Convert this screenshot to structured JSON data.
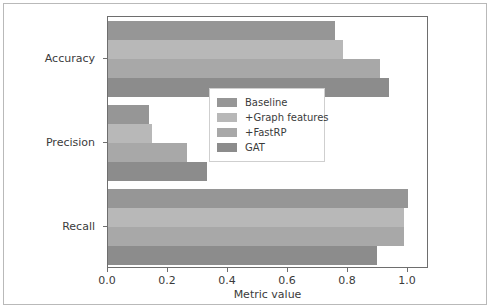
{
  "chart_data": {
    "type": "bar",
    "orientation": "horizontal",
    "title": "",
    "xlabel": "Metric value",
    "ylabel": "",
    "categories": [
      "Accuracy",
      "Precision",
      "Recall"
    ],
    "series": [
      {
        "name": "Baseline",
        "color": "#969696",
        "values": [
          0.758,
          0.136,
          1.0
        ]
      },
      {
        "name": "+Graph features",
        "color": "#b8b8b8",
        "values": [
          0.784,
          0.146,
          0.985
        ]
      },
      {
        "name": "+FastRP",
        "color": "#a8a8a8",
        "values": [
          0.905,
          0.264,
          0.985
        ]
      },
      {
        "name": "GAT",
        "color": "#8c8c8c",
        "values": [
          0.937,
          0.33,
          0.895
        ]
      }
    ],
    "xlim": [
      0.0,
      1.07
    ],
    "xticks": [
      0.0,
      0.2,
      0.4,
      0.6,
      0.8,
      1.0
    ],
    "xtick_labels": [
      "0.0",
      "0.2",
      "0.4",
      "0.6",
      "0.8",
      "1.0"
    ],
    "grid": false,
    "legend_position": "upper right",
    "legend_entries": [
      "Baseline",
      "+Graph features",
      "+FastRP",
      "GAT"
    ]
  },
  "figure": {
    "background_color": "#ffffff",
    "axes_edge_color": "#6e6e6e",
    "text_color": "#3b3b3b"
  }
}
